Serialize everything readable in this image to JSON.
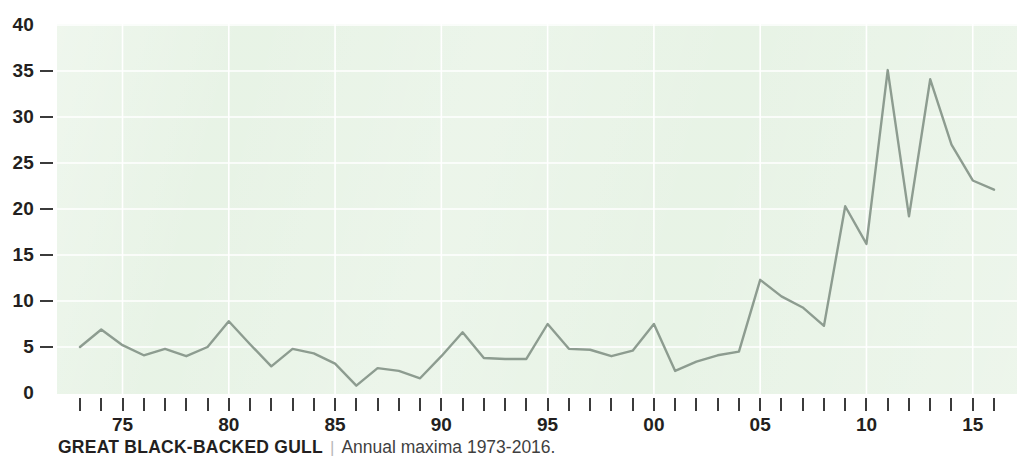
{
  "caption": {
    "title": "GREAT BLACK-BACKED GULL",
    "divider": "|",
    "subtitle": "Annual maxima 1973-2016."
  },
  "colors": {
    "plot_background": "#e5f2e3",
    "gridline": "#ffffff",
    "series_line": "#8d9c90",
    "axis_text": "#231f20",
    "tick_mark": "#3b3b3b",
    "caption_divider": "#b9b9b9"
  },
  "chart_data": {
    "type": "line",
    "title": "GREAT BLACK-BACKED GULL",
    "subtitle": "Annual maxima 1973-2016.",
    "xlabel": "",
    "ylabel": "",
    "xlim": [
      1973,
      2016
    ],
    "ylim": [
      0,
      40
    ],
    "grid": true,
    "legend": null,
    "y_ticks": [
      0,
      5,
      10,
      15,
      20,
      25,
      30,
      35,
      40
    ],
    "y_tick_labels": [
      "0",
      "5",
      "10",
      "15",
      "20",
      "25",
      "30",
      "35",
      "40"
    ],
    "x_ticks": [
      1975,
      1980,
      1985,
      1990,
      1995,
      2000,
      2005,
      2010,
      2015
    ],
    "x_tick_labels": [
      "75",
      "80",
      "85",
      "90",
      "95",
      "00",
      "05",
      "10",
      "15"
    ],
    "x_minor_ticks_every": 1,
    "x": [
      1973,
      1974,
      1975,
      1976,
      1977,
      1978,
      1979,
      1980,
      1981,
      1982,
      1983,
      1984,
      1985,
      1986,
      1987,
      1988,
      1989,
      1990,
      1991,
      1992,
      1993,
      1994,
      1995,
      1996,
      1997,
      1998,
      1999,
      2000,
      2001,
      2002,
      2003,
      2004,
      2005,
      2006,
      2007,
      2008,
      2009,
      2010,
      2011,
      2012,
      2013,
      2014,
      2015,
      2016
    ],
    "values": [
      5.0,
      6.9,
      5.2,
      4.1,
      4.8,
      4.0,
      5.0,
      7.8,
      5.3,
      2.9,
      4.8,
      4.3,
      3.2,
      0.8,
      2.7,
      2.4,
      1.6,
      4.0,
      6.6,
      3.8,
      3.7,
      3.7,
      7.5,
      4.8,
      4.7,
      4.0,
      4.6,
      7.5,
      2.4,
      3.4,
      4.1,
      4.5,
      12.3,
      10.5,
      9.3,
      7.3,
      20.3,
      16.2,
      35.1,
      19.2,
      34.1,
      27.0,
      23.1,
      22.1
    ]
  }
}
